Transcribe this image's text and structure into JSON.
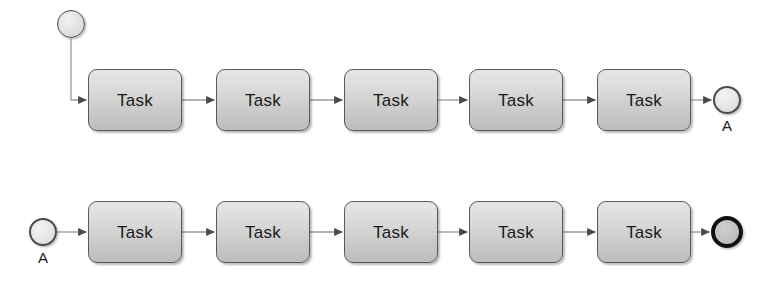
{
  "diagram": {
    "type": "bpmn-process-flow",
    "background_color": "#ffffff",
    "width": 773,
    "height": 286,
    "connector_color": "#9a9a9a",
    "arrowhead_color": "#4a4a4a",
    "task_border_color": "#58595b",
    "task_fill_top": "#e6e6e6",
    "task_fill_bottom": "#bdbdbd",
    "task_text_color": "#1b1b1b",
    "event_border_color": "#4a4a4a",
    "end_event_border_color": "#111111"
  },
  "rows": [
    {
      "name": "top-lane",
      "start_event": {
        "label": "",
        "shape": "circle-thin"
      },
      "tasks": [
        {
          "label": "Task"
        },
        {
          "label": "Task"
        },
        {
          "label": "Task"
        },
        {
          "label": "Task"
        },
        {
          "label": "Task"
        }
      ],
      "end_event": {
        "label": "A",
        "shape": "link-throw-double-circle"
      }
    },
    {
      "name": "bottom-lane",
      "start_event": {
        "label": "A",
        "shape": "link-catch-double-circle"
      },
      "tasks": [
        {
          "label": "Task"
        },
        {
          "label": "Task"
        },
        {
          "label": "Task"
        },
        {
          "label": "Task"
        },
        {
          "label": "Task"
        }
      ],
      "end_event": {
        "label": "",
        "shape": "circle-thick"
      }
    }
  ]
}
